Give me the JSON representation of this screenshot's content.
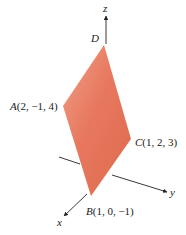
{
  "figure": {
    "type": "3d-parallelogram-diagram",
    "fill_color": "#e5745a",
    "fill_color_light": "#ef9a80",
    "axis_color": "#222222",
    "axes": {
      "x": {
        "label": "x"
      },
      "y": {
        "label": "y"
      },
      "z": {
        "label": "z"
      }
    },
    "vertices": [
      {
        "name": "D",
        "label": "D",
        "coords": ""
      },
      {
        "name": "A",
        "label": "A",
        "coords": "(2, −1, 4)"
      },
      {
        "name": "C",
        "label": "C",
        "coords": "(1, 2, 3)"
      },
      {
        "name": "B",
        "label": "B",
        "coords": "(1, 0, −1)"
      }
    ]
  }
}
